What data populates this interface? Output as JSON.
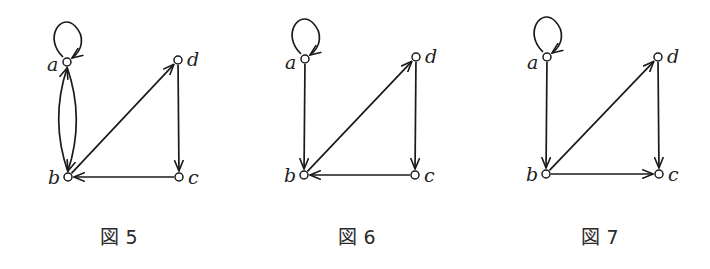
{
  "figures": [
    {
      "id": "fig5",
      "caption": "図 5",
      "caption_pos": [
        119,
        244
      ],
      "nodes": [
        {
          "id": "a",
          "label": "a",
          "x": 67,
          "y": 62,
          "label_dx": -20,
          "label_dy": 9
        },
        {
          "id": "b",
          "label": "b",
          "x": 68,
          "y": 177,
          "label_dx": -20,
          "label_dy": 7
        },
        {
          "id": "c",
          "label": "c",
          "x": 179,
          "y": 177,
          "label_dx": 9,
          "label_dy": 7
        },
        {
          "id": "d",
          "label": "d",
          "x": 178,
          "y": 60,
          "label_dx": 9,
          "label_dy": 6
        }
      ],
      "edges": [
        {
          "from": "a",
          "to": "a",
          "type": "loop"
        },
        {
          "from": "a",
          "to": "b",
          "type": "curve",
          "bend": 11
        },
        {
          "from": "b",
          "to": "a",
          "type": "curve",
          "bend": 11
        },
        {
          "from": "b",
          "to": "d",
          "type": "straight"
        },
        {
          "from": "d",
          "to": "c",
          "type": "straight"
        },
        {
          "from": "c",
          "to": "b",
          "type": "straight"
        }
      ]
    },
    {
      "id": "fig6",
      "caption": "図 6",
      "caption_pos": [
        357,
        244
      ],
      "nodes": [
        {
          "id": "a",
          "label": "a",
          "x": 305,
          "y": 59,
          "label_dx": -20,
          "label_dy": 10
        },
        {
          "id": "b",
          "label": "b",
          "x": 304,
          "y": 175,
          "label_dx": -20,
          "label_dy": 7
        },
        {
          "id": "c",
          "label": "c",
          "x": 415,
          "y": 175,
          "label_dx": 9,
          "label_dy": 7
        },
        {
          "id": "d",
          "label": "d",
          "x": 416,
          "y": 57,
          "label_dx": 9,
          "label_dy": 6
        }
      ],
      "edges": [
        {
          "from": "a",
          "to": "a",
          "type": "loop"
        },
        {
          "from": "a",
          "to": "b",
          "type": "straight"
        },
        {
          "from": "b",
          "to": "d",
          "type": "straight"
        },
        {
          "from": "d",
          "to": "c",
          "type": "straight"
        },
        {
          "from": "c",
          "to": "b",
          "type": "straight"
        }
      ]
    },
    {
      "id": "fig7",
      "caption": "図 7",
      "caption_pos": [
        600,
        244
      ],
      "nodes": [
        {
          "id": "a",
          "label": "a",
          "x": 547,
          "y": 57,
          "label_dx": -20,
          "label_dy": 12
        },
        {
          "id": "b",
          "label": "b",
          "x": 546,
          "y": 174,
          "label_dx": -20,
          "label_dy": 7
        },
        {
          "id": "c",
          "label": "c",
          "x": 659,
          "y": 174,
          "label_dx": 9,
          "label_dy": 7
        },
        {
          "id": "d",
          "label": "d",
          "x": 658,
          "y": 57,
          "label_dx": 9,
          "label_dy": 6
        }
      ],
      "edges": [
        {
          "from": "a",
          "to": "a",
          "type": "loop"
        },
        {
          "from": "a",
          "to": "b",
          "type": "straight"
        },
        {
          "from": "b",
          "to": "d",
          "type": "straight"
        },
        {
          "from": "d",
          "to": "c",
          "type": "straight"
        },
        {
          "from": "b",
          "to": "c",
          "type": "straight"
        }
      ]
    }
  ],
  "style": {
    "stroke_color": "#1a1a1a",
    "node_radius": 4
  }
}
